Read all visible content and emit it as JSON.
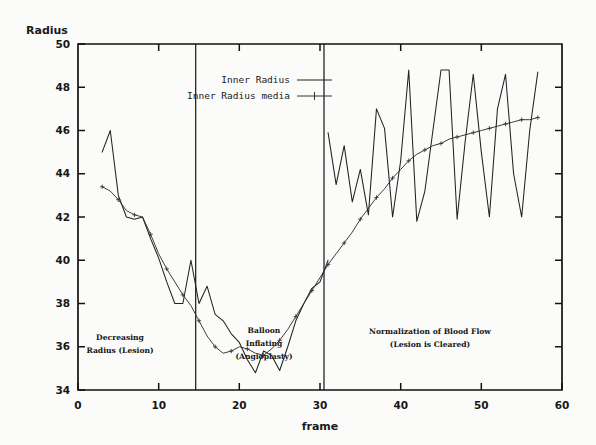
{
  "figure": {
    "background_color": "#fbfbfa",
    "ink_color": "#141414",
    "width": 596,
    "height": 445
  },
  "axes": {
    "y_title": "Radius",
    "x_title": "frame",
    "y_ticks": [
      "34",
      "36",
      "38",
      "40",
      "42",
      "44",
      "46",
      "48",
      "50"
    ],
    "x_ticks": [
      "0",
      "10",
      "20",
      "30",
      "40",
      "50",
      "60"
    ]
  },
  "legend": {
    "entries": [
      {
        "label": "Inner Radius",
        "style": "solid"
      },
      {
        "label": "Inner Radius media",
        "style": "line-with-plus-markers"
      }
    ]
  },
  "annotations": [
    {
      "id": "phase-1",
      "lines": [
        "Decreasing",
        "Radius (Lesion)"
      ]
    },
    {
      "id": "phase-2",
      "lines": [
        "Balloon",
        "Inflating",
        "(Angioplasty)"
      ]
    },
    {
      "id": "phase-3",
      "lines": [
        "Normalization of Blood Flow",
        "(Lesion is Cleared)"
      ]
    }
  ],
  "chart_data": {
    "type": "line",
    "title": "",
    "xlabel": "frame",
    "ylabel": "Radius",
    "xlim": [
      0,
      60
    ],
    "ylim": [
      34,
      50
    ],
    "xtick_step": 10,
    "ytick_step": 2,
    "grid": false,
    "legend_position": "top-center-inside",
    "phase_dividers": [
      14.6,
      30.5
    ],
    "phase_labels": [
      "Decreasing Radius (Lesion)",
      "Balloon Inflating (Angioplasty)",
      "Normalization of Blood Flow (Lesion is Cleared)"
    ],
    "series": [
      {
        "name": "Inner Radius",
        "style": "solid",
        "x": [
          3,
          4,
          5,
          6,
          7,
          8,
          9,
          10,
          11,
          12,
          13,
          14,
          15,
          16,
          17,
          18,
          19,
          20,
          21,
          22,
          23,
          24,
          25,
          26,
          27,
          28,
          29,
          30,
          31,
          32,
          33,
          34,
          35,
          36,
          37,
          38,
          39,
          40,
          41,
          42,
          43,
          44,
          45,
          46,
          47,
          48,
          49,
          50,
          51,
          52,
          53,
          54,
          55,
          56,
          57
        ],
        "values": [
          45.0,
          46.0,
          43.0,
          42.0,
          41.9,
          42.0,
          41.0,
          40.1,
          39.0,
          38.0,
          38.0,
          40.0,
          38.0,
          38.8,
          37.5,
          37.2,
          36.6,
          36.2,
          35.4,
          34.8,
          35.8,
          35.6,
          34.9,
          36.0,
          37.2,
          38.0,
          38.7,
          39.0,
          40.0,
          40.2,
          41.0,
          41.1,
          42.0,
          42.2,
          43.6,
          42.2,
          43.0,
          44.1,
          45.0,
          45.0,
          45.4,
          45.0,
          44.0,
          46.1,
          43.6,
          45.0,
          46.4,
          47.0,
          45.0,
          45.9,
          46.1,
          46.3,
          45.2,
          46.0,
          46.5
        ]
      },
      {
        "name": "Inner Radius media",
        "style": "line-with-plus-markers",
        "x": [
          3,
          4,
          5,
          6,
          7,
          8,
          9,
          10,
          11,
          12,
          13,
          14,
          15,
          16,
          17,
          18,
          19,
          20,
          21,
          22,
          23,
          24,
          25,
          26,
          27,
          28,
          29,
          30,
          31,
          32,
          33,
          34,
          35,
          36,
          37,
          38,
          39,
          40,
          41,
          42,
          43,
          44,
          45,
          46,
          47,
          48,
          49,
          50,
          51,
          52,
          53,
          54,
          55,
          56,
          57
        ],
        "values": [
          43.4,
          43.2,
          42.8,
          42.3,
          42.1,
          42.0,
          41.2,
          40.3,
          39.6,
          39.0,
          38.4,
          37.9,
          37.2,
          36.5,
          36.0,
          35.7,
          35.8,
          36.0,
          35.9,
          35.7,
          35.6,
          35.9,
          36.3,
          36.8,
          37.4,
          38.0,
          38.6,
          39.2,
          39.8,
          40.3,
          40.8,
          41.3,
          41.9,
          42.4,
          42.9,
          43.3,
          43.8,
          44.2,
          44.6,
          44.9,
          45.1,
          45.3,
          45.4,
          45.6,
          45.7,
          45.8,
          45.9,
          46.0,
          46.1,
          46.2,
          46.3,
          46.4,
          46.5,
          46.5,
          46.6
        ]
      },
      {
        "name": "Inner Radius (oscillatory phase detail)",
        "style": "solid-overlay",
        "note": "dense rapid oscillation between ~41.8 and ~48.8 after frame 31",
        "x": [
          31,
          32,
          33,
          34,
          35,
          36,
          37,
          38,
          39,
          40,
          41,
          42,
          43,
          44,
          45,
          46,
          47,
          48,
          49,
          50,
          51,
          52,
          53,
          54,
          55,
          56,
          57
        ],
        "values": [
          45.9,
          43.5,
          45.3,
          42.7,
          44.2,
          42.1,
          47.0,
          46.1,
          42.0,
          44.6,
          48.8,
          41.8,
          43.2,
          46.0,
          48.8,
          48.8,
          41.9,
          45.5,
          48.6,
          45.0,
          42.0,
          47.0,
          48.6,
          44.0,
          42.0,
          46.0,
          48.7
        ]
      }
    ]
  }
}
